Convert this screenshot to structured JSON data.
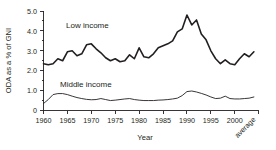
{
  "chart_data": {
    "type": "line",
    "title": "",
    "xlabel": "Year",
    "ylabel": "ODA as a % of GNI",
    "ylim": [
      0,
      5.0
    ],
    "ytick_labels": [
      "0",
      "1.0",
      "2.0",
      "3.0",
      "4.0",
      "5.0"
    ],
    "ytick_values": [
      0,
      1.0,
      2.0,
      3.0,
      4.0,
      5.0
    ],
    "xtick_labels": [
      "1960",
      "1965",
      "1970",
      "1975",
      "1980",
      "1985",
      "1990",
      "1995",
      "2000",
      "average"
    ],
    "xtick_values": [
      1960,
      1965,
      1970,
      1975,
      1980,
      1985,
      1990,
      1995,
      2000,
      2004
    ],
    "xlim": [
      1960,
      2004
    ],
    "grid": false,
    "legend": "inline-annotations",
    "annotations": [
      {
        "text": "Low income",
        "x": 1971.5,
        "y": 3.95
      },
      {
        "text": "Middle income",
        "x": 1969.5,
        "y": 1.35
      }
    ],
    "x": [
      1960,
      1961,
      1962,
      1963,
      1964,
      1965,
      1966,
      1967,
      1968,
      1969,
      1970,
      1971,
      1972,
      1973,
      1974,
      1975,
      1976,
      1977,
      1978,
      1979,
      1980,
      1981,
      1982,
      1983,
      1984,
      1985,
      1986,
      1987,
      1988,
      1989,
      1990,
      1991,
      1992,
      1993,
      1994,
      1995,
      1996,
      1997,
      1998,
      1999,
      2000,
      2001,
      2002,
      2003,
      2004
    ],
    "series": [
      {
        "name": "Low income",
        "values": [
          2.35,
          2.3,
          2.35,
          2.6,
          2.5,
          2.95,
          3.0,
          2.75,
          2.85,
          3.3,
          3.35,
          3.1,
          2.9,
          2.65,
          2.5,
          2.6,
          2.45,
          2.5,
          2.8,
          2.6,
          3.15,
          2.7,
          2.65,
          2.85,
          3.15,
          3.25,
          3.35,
          3.5,
          3.95,
          4.1,
          4.8,
          4.3,
          4.55,
          3.85,
          3.55,
          3.0,
          2.6,
          2.35,
          2.55,
          2.35,
          2.3,
          2.6,
          2.85,
          2.7,
          2.95
        ]
      },
      {
        "name": "Middle income",
        "values": [
          0.35,
          0.55,
          0.8,
          0.85,
          0.85,
          0.8,
          0.72,
          0.65,
          0.6,
          0.56,
          0.54,
          0.55,
          0.6,
          0.55,
          0.5,
          0.52,
          0.55,
          0.58,
          0.6,
          0.55,
          0.52,
          0.5,
          0.5,
          0.5,
          0.52,
          0.53,
          0.55,
          0.58,
          0.62,
          0.75,
          0.95,
          0.98,
          0.93,
          0.86,
          0.78,
          0.68,
          0.6,
          0.62,
          0.72,
          0.6,
          0.58,
          0.58,
          0.6,
          0.62,
          0.68
        ]
      }
    ]
  },
  "axes": {
    "y_title": "ODA as a % of GNI",
    "x_title": "Year",
    "average_label": "average"
  },
  "labels": {
    "low_income": "Low income",
    "middle_income": "Middle income"
  },
  "colors": {
    "ink": "#231f20",
    "background": "#ffffff"
  }
}
